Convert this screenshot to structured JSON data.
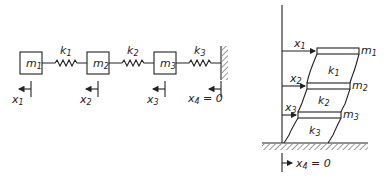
{
  "left_diagram": {
    "masses": [
      {
        "base": "m",
        "sub": "1"
      },
      {
        "base": "m",
        "sub": "2"
      },
      {
        "base": "m",
        "sub": "3"
      }
    ],
    "springs": [
      {
        "base": "k",
        "sub": "1"
      },
      {
        "base": "k",
        "sub": "2"
      },
      {
        "base": "k",
        "sub": "3"
      }
    ],
    "displacements": [
      {
        "base": "x",
        "sub": "1"
      },
      {
        "base": "x",
        "sub": "2"
      },
      {
        "base": "x",
        "sub": "3"
      },
      {
        "base": "x",
        "sub": "4",
        "suffix": " = 0"
      }
    ]
  },
  "right_diagram": {
    "floors": [
      {
        "base": "m",
        "sub": "1"
      },
      {
        "base": "m",
        "sub": "2"
      },
      {
        "base": "m",
        "sub": "3"
      }
    ],
    "stories": [
      {
        "base": "k",
        "sub": "1"
      },
      {
        "base": "k",
        "sub": "2"
      },
      {
        "base": "k",
        "sub": "3"
      }
    ],
    "displacements": [
      {
        "base": "x",
        "sub": "1"
      },
      {
        "base": "x",
        "sub": "2"
      },
      {
        "base": "x",
        "sub": "3"
      },
      {
        "base": "x",
        "sub": "4",
        "suffix": " = 0"
      }
    ]
  }
}
